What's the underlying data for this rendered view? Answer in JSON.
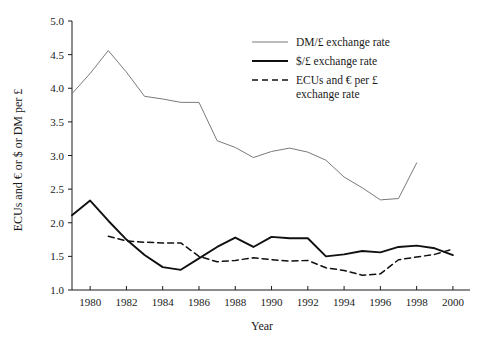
{
  "chart_data": {
    "type": "line",
    "title": "",
    "xlabel": "Year",
    "ylabel": "ECUs and € or $ or DM per £",
    "xlim": [
      1979,
      2000.5
    ],
    "ylim": [
      1.0,
      5.0
    ],
    "grid": false,
    "legend_position": "top-right",
    "xticks": [
      1980,
      1982,
      1984,
      1986,
      1988,
      1990,
      1992,
      1994,
      1996,
      1998,
      2000
    ],
    "xtick_labels": [
      "1980",
      "1982",
      "1984",
      "1986",
      "1988",
      "1990",
      "1992",
      "1994",
      "1996",
      "1998",
      "2000"
    ],
    "yticks": [
      1.0,
      1.5,
      2.0,
      2.5,
      3.0,
      3.5,
      4.0,
      4.5,
      5.0
    ],
    "ytick_labels": [
      "1.0",
      "1.5",
      "2.0",
      "2.5",
      "3.0",
      "3.5",
      "4.0",
      "4.5",
      "5.0"
    ],
    "series": [
      {
        "name": "DM/£ exchange rate",
        "style": "solid-thin",
        "color": "#7a7a7a",
        "x": [
          1979,
          1980,
          1981,
          1982,
          1983,
          1984,
          1985,
          1986,
          1987,
          1988,
          1989,
          1990,
          1991,
          1992,
          1993,
          1994,
          1995,
          1996,
          1997,
          1998
        ],
        "values": [
          3.92,
          4.22,
          4.56,
          4.24,
          3.88,
          3.84,
          3.79,
          3.79,
          3.22,
          3.12,
          2.97,
          3.06,
          3.11,
          3.05,
          2.93,
          2.68,
          2.52,
          2.34,
          2.36,
          2.89
        ]
      },
      {
        "name": "$/£ exchange rate",
        "style": "solid-thick",
        "color": "#101010",
        "x": [
          1979,
          1980,
          1981,
          1982,
          1983,
          1984,
          1985,
          1986,
          1987,
          1988,
          1989,
          1990,
          1991,
          1992,
          1993,
          1994,
          1995,
          1996,
          1997,
          1998,
          1999,
          2000
        ],
        "values": [
          2.11,
          2.33,
          2.03,
          1.75,
          1.52,
          1.34,
          1.3,
          1.47,
          1.64,
          1.78,
          1.64,
          1.79,
          1.77,
          1.77,
          1.5,
          1.53,
          1.58,
          1.56,
          1.64,
          1.66,
          1.62,
          1.52
        ]
      },
      {
        "name": "ECUs and € per £ exchange rate",
        "style": "dashed",
        "color": "#101010",
        "x": [
          1981,
          1982,
          1983,
          1984,
          1985,
          1986,
          1987,
          1988,
          1989,
          1990,
          1991,
          1992,
          1993,
          1994,
          1995,
          1996,
          1997,
          1998,
          1999,
          2000
        ],
        "values": [
          1.8,
          1.73,
          1.71,
          1.7,
          1.7,
          1.5,
          1.42,
          1.44,
          1.48,
          1.45,
          1.43,
          1.44,
          1.33,
          1.29,
          1.22,
          1.24,
          1.45,
          1.49,
          1.53,
          1.61
        ]
      }
    ]
  },
  "legend": {
    "items": [
      {
        "label": "DM/£ exchange rate",
        "style": "solid-thin"
      },
      {
        "label": "$/£ exchange rate",
        "style": "solid-thick"
      },
      {
        "label": "ECUs and € per £",
        "label2": "exchange rate",
        "style": "dashed"
      }
    ]
  },
  "colors": {
    "axis": "#1a1a1a",
    "dm_line": "#7a7a7a",
    "usd_line": "#101010",
    "ecu_line": "#101010",
    "background": "#ffffff"
  }
}
